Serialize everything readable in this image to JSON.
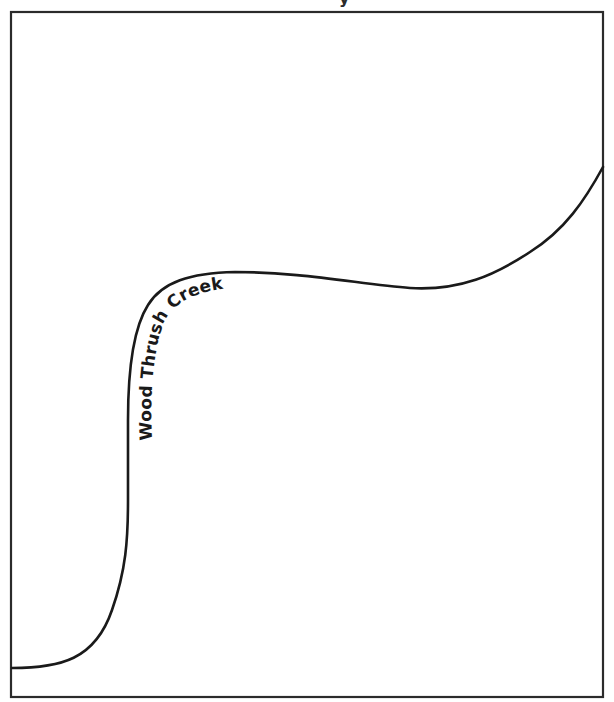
{
  "map": {
    "title_fragment": "y",
    "frame": {
      "left": 11,
      "top": 12,
      "right": 603,
      "bottom": 697,
      "stroke_color": "#2b2b2b"
    },
    "creek": {
      "label": "Wood Thrush Creek",
      "stroke_color": "#1a1a1a"
    }
  }
}
